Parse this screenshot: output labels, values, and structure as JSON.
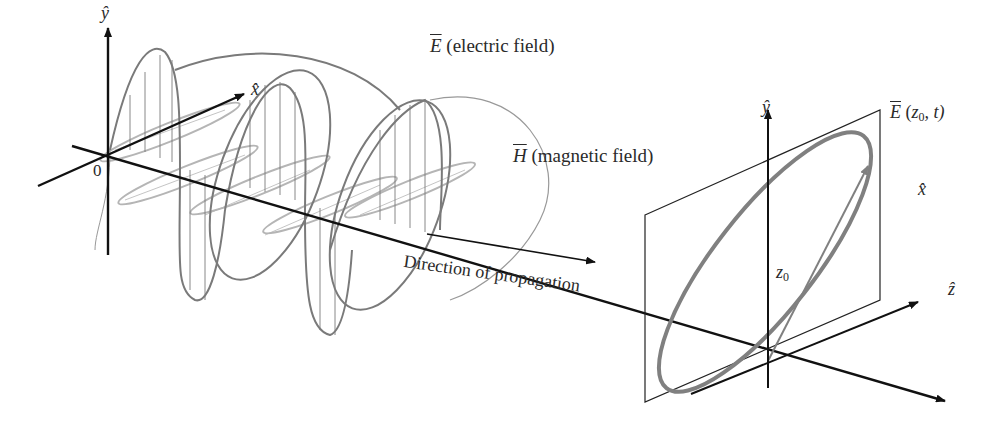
{
  "diagram": {
    "colors": {
      "axis": "#111111",
      "electric_field": "#7a7a7a",
      "magnetic_field": "#b5b5b5",
      "polarization_ellipse": "#808080",
      "plane": "#222222"
    },
    "left_axes": {
      "y_label": "ŷ",
      "x_label": "x̂",
      "origin_label": "0"
    },
    "labels": {
      "electric_field_symbol": "E",
      "electric_field_text": " (electric field)",
      "magnetic_field_symbol": "H",
      "magnetic_field_text": " (magnetic field)",
      "direction": "Direction of propagation"
    },
    "right_plane": {
      "y_label": "ŷ",
      "x_label": "x̂",
      "z_label": "ẑ",
      "position_symbol": "z",
      "position_subscript": "0",
      "field_symbol": "E",
      "field_args_open": " (",
      "field_args_z": "z",
      "field_args_sub": "0",
      "field_args_rest": ", t)"
    }
  }
}
